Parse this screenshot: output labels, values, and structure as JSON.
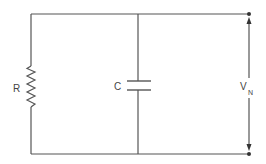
{
  "diagram": {
    "type": "circuit",
    "components": {
      "resistor": {
        "label": "R"
      },
      "capacitor": {
        "label": "C"
      },
      "voltage": {
        "label": "V",
        "subscript": "N"
      }
    },
    "colors": {
      "line": "#555555",
      "text": "#444444",
      "background": "#ffffff"
    }
  }
}
